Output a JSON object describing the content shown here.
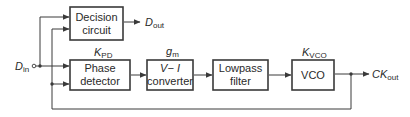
{
  "diagram": {
    "type": "block-diagram",
    "input": {
      "symbol": "D",
      "subscript": "in"
    },
    "outputs": {
      "data": {
        "symbol": "D",
        "subscript": "out"
      },
      "clock": {
        "symbol": "CK",
        "subscript": "out"
      }
    },
    "blocks": [
      {
        "id": "decision",
        "line1": "Decision",
        "line2": "circuit"
      },
      {
        "id": "pd",
        "line1": "Phase",
        "line2": "detector",
        "gain_symbol": "K",
        "gain_sub": "PD"
      },
      {
        "id": "vi",
        "line1": "V− I",
        "line2": "converter",
        "gain_symbol": "g",
        "gain_sub": "m"
      },
      {
        "id": "lpf",
        "line1": "Lowpass",
        "line2": "filter"
      },
      {
        "id": "vco",
        "line1": "VCO",
        "gain_symbol": "K",
        "gain_sub": "VCO"
      }
    ],
    "connections": [
      "D_in -> Decision circuit (data input)",
      "D_in -> Phase detector (data input)",
      "Phase detector -> V-I converter",
      "V-I converter -> Lowpass filter",
      "Lowpass filter -> VCO",
      "VCO -> CK_out",
      "VCO -> Phase detector (feedback clock)",
      "VCO -> Decision circuit (clock)",
      "Decision circuit -> D_out"
    ],
    "colors": {
      "stroke": "#3a3a3a",
      "text": "#2a2a2a",
      "background": "#ffffff"
    }
  }
}
